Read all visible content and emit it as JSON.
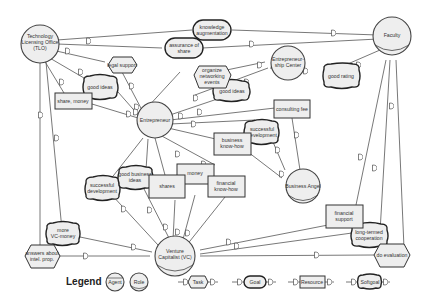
{
  "actors": {
    "tlo": {
      "lines": [
        "Technology",
        "Licensing Office",
        "(TLO)"
      ]
    },
    "faculty": {
      "lines": [
        "Faculty"
      ]
    },
    "entrepreneurship_center": {
      "lines": [
        "Entrepreneur-",
        "ship Center"
      ]
    },
    "entrepreneur": {
      "lines": [
        "Entrepreneur"
      ]
    },
    "business_angel": {
      "lines": [
        "Business Angel"
      ]
    },
    "venture_capitalist": {
      "lines": [
        "Venture",
        "Capitalist (VC)"
      ]
    }
  },
  "goals": {
    "knowledge_augmentation": {
      "lines": [
        "knowledge",
        "augmentation"
      ]
    },
    "assurance_of_share": {
      "lines": [
        "assurance of",
        "share"
      ]
    }
  },
  "softgoals": {
    "good_ideas_tlo": {
      "lines": [
        "good ideas"
      ]
    },
    "good_ideas_center": {
      "lines": [
        "good ideas"
      ]
    },
    "good_rating": {
      "lines": [
        "good rating"
      ]
    },
    "successful_development_ba": {
      "lines": [
        "successful",
        "development"
      ]
    },
    "successful_development_vc": {
      "lines": [
        "successful",
        "development"
      ]
    },
    "good_business_ideas": {
      "lines": [
        "good business",
        "ideas"
      ]
    },
    "more_vc_money": {
      "lines": [
        "more",
        "VC-money"
      ]
    },
    "long_termed_cooperation": {
      "lines": [
        "long-termed",
        "cooperation"
      ]
    }
  },
  "tasks": {
    "legal_support": {
      "lines": [
        "legal support"
      ]
    },
    "organize_networking_events": {
      "lines": [
        "organize",
        "networking",
        "events"
      ]
    },
    "answers_about_intel_prop": {
      "lines": [
        "answers about",
        "intel. prop."
      ]
    },
    "do_evaluation": {
      "lines": [
        "do evaluation"
      ]
    }
  },
  "resources": {
    "share_money": {
      "lines": [
        "share, money"
      ]
    },
    "consulting_fee": {
      "lines": [
        "consulting fee"
      ]
    },
    "business_know_how": {
      "lines": [
        "business",
        "know-how"
      ]
    },
    "money": {
      "lines": [
        "money"
      ]
    },
    "shares": {
      "lines": [
        "shares"
      ]
    },
    "financial_know_how": {
      "lines": [
        "financial",
        "know-how"
      ]
    },
    "financial_support": {
      "lines": [
        "financial",
        "support"
      ]
    }
  },
  "legend": {
    "title": "Legend",
    "agent": "Agent",
    "role": "Role",
    "task": "Task",
    "goal": "Goal",
    "resource": "Resource",
    "softgoal": "Softgoal"
  }
}
